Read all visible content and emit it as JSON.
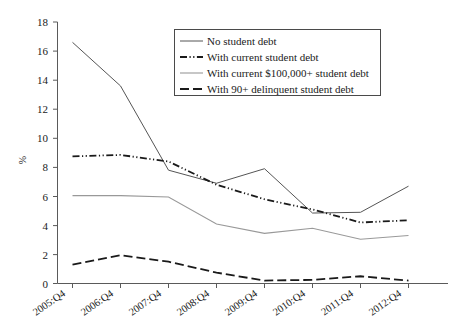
{
  "chart_data": {
    "type": "line",
    "title": "",
    "xlabel": "",
    "ylabel": "%",
    "ylim": [
      0,
      18
    ],
    "ytick_step": 2,
    "yticks": [
      "0",
      "2",
      "4",
      "6",
      "8",
      "10",
      "12",
      "14",
      "16",
      "18"
    ],
    "grid": false,
    "legend_position": "top-center",
    "categories": [
      "2005:Q4",
      "2006:Q4",
      "2007:Q4",
      "2008:Q4",
      "2009:Q4",
      "2010:Q4",
      "2011:Q4",
      "2012:Q4"
    ],
    "series": [
      {
        "name": "No student debt",
        "style": "solid-thin-dark",
        "color": "#555555",
        "values": [
          16.6,
          13.6,
          7.8,
          6.9,
          7.9,
          4.85,
          4.9,
          6.7
        ]
      },
      {
        "name": "With current student debt",
        "style": "dash-dot-dot-bold",
        "color": "#1a1a1a",
        "values": [
          8.75,
          8.85,
          8.4,
          6.8,
          5.8,
          5.1,
          4.2,
          4.35
        ]
      },
      {
        "name": "With current $100,000+ student debt",
        "style": "solid-gray",
        "color": "#999999",
        "values": [
          6.05,
          6.05,
          5.95,
          4.1,
          3.45,
          3.8,
          3.05,
          3.3
        ]
      },
      {
        "name": "With 90+ delinquent student debt",
        "style": "dashed-bold",
        "color": "#1a1a1a",
        "values": [
          1.3,
          1.95,
          1.5,
          0.75,
          0.2,
          0.25,
          0.5,
          0.2
        ]
      }
    ]
  },
  "legend": {
    "items": [
      {
        "label": "No student debt",
        "swatch": "solid-thin-dark-swatch"
      },
      {
        "label": "With current student debt",
        "swatch": "dash-dot-dot-swatch"
      },
      {
        "label": "With current $100,000+ student debt",
        "swatch": "solid-gray-swatch"
      },
      {
        "label": "With 90+ delinquent student debt",
        "swatch": "dashed-swatch"
      }
    ]
  }
}
